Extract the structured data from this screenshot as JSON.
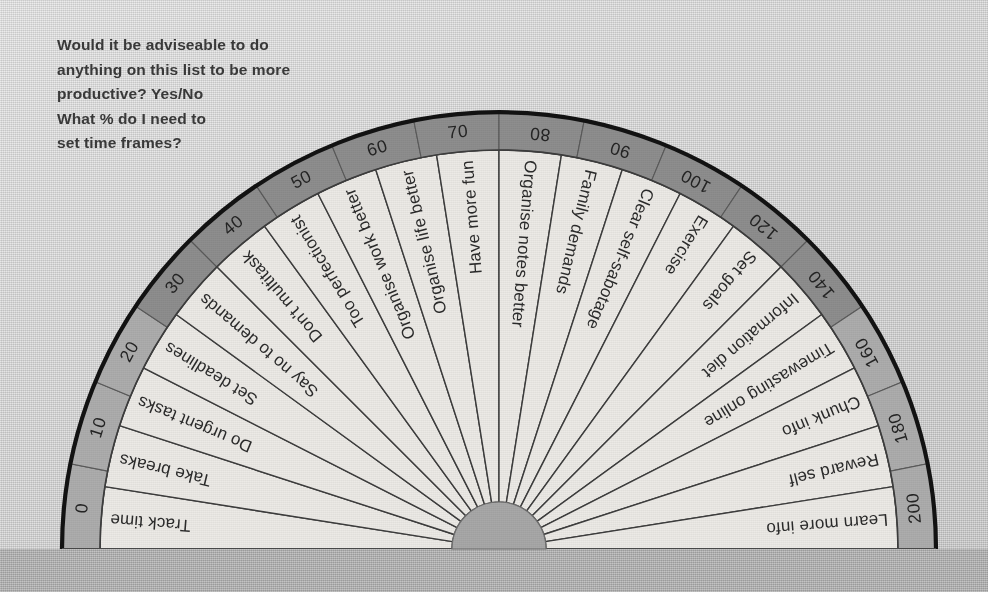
{
  "header": {
    "note": "Would it be adviseable to do\nanything on this list to be more\nproductive?  Yes/No\nWhat % do I need to\nset time frames?"
  },
  "colors": {
    "page_background": "#d6d6d6",
    "base_band": "#b2b2b2",
    "sector_fill": "#eceae6",
    "sector_stroke": "#3d3d3d",
    "ring_fill_dark": "#8e8e8e",
    "ring_fill_light": "#adadad",
    "ring_outline": "#121212",
    "hub_fill": "#a8a8a8",
    "label_text": "#2b2b2b",
    "header_text": "#3a3a3a"
  },
  "chart_data": {
    "type": "pie",
    "title": "",
    "subtitle": "",
    "xlabel": "",
    "ylabel": "",
    "legend_position": "none",
    "grid": false,
    "shape": "semicircle-protractor",
    "sweep_degrees": 180,
    "sector_count": 20,
    "categories": [
      "Track time",
      "Take breaks",
      "Do urgent tasks",
      "Set deadlines",
      "Say no to demands",
      "Don't multitask",
      "Too perfectionist",
      "Organise work better",
      "Organise life better",
      "Have more fun",
      "Organise notes better",
      "Family demands",
      "Clear self-sabotage",
      "Exercise",
      "Set goals",
      "Information diet",
      "Timewasting online",
      "Chunk info",
      "Reward self",
      "Learn more info"
    ],
    "values": [
      9,
      9,
      9,
      9,
      9,
      9,
      9,
      9,
      9,
      9,
      9,
      9,
      9,
      9,
      9,
      9,
      9,
      9,
      9,
      9
    ],
    "scale_ring": {
      "label": "degree scale",
      "tick_labels": [
        "0",
        "10",
        "20",
        "30",
        "40",
        "50",
        "60",
        "70",
        "80",
        "90",
        "100",
        "120",
        "140",
        "160",
        "180",
        "200"
      ],
      "tick_count": 16,
      "axis_range": [
        0,
        200
      ]
    }
  }
}
